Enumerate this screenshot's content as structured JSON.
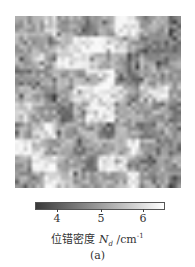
{
  "chart_data": {
    "type": "heatmap",
    "title": "",
    "colormap": "gray",
    "colorbar": {
      "label_prefix": "位错密度 ",
      "label_symbol": "N",
      "label_sub": "d",
      "label_unit": " /cm",
      "label_sup": "-1",
      "ticks": [
        "4",
        "5",
        "6"
      ],
      "tick_values": [
        4,
        5,
        6
      ],
      "range": [
        3.5,
        6.5
      ],
      "low_color": "#3a3a3a",
      "high_color": "#ffffff"
    },
    "grid": {
      "cols": 40,
      "rows": 42
    },
    "regions_description": "mottled gray dislocation density map; light regions upper-left-center, center, lower-left; darker clusters upper-right and lower-right",
    "coarse_layout": [
      "MMLMMDMHHMMD",
      "MMMLHHHLMDDD",
      "MLMHHLMMDMDM",
      "DMMMMLHMDMMM",
      "MMDMHHHLMLHM",
      "LMMDMHHMMMMD",
      "MLHMMMDMMDMM",
      "HLMMDMMMHMDD",
      "MHHMMDHHMDMM",
      "MMHLMMMMHMMD"
    ]
  },
  "figure": {
    "sublabel": "(a)"
  }
}
